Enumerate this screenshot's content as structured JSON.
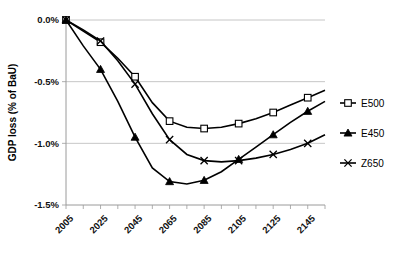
{
  "chart_data": {
    "type": "line",
    "title": "",
    "xlabel": "",
    "ylabel": "GDP loss (% of BaU)",
    "xlim": [
      2005,
      2155
    ],
    "ylim": [
      -1.5,
      0.0
    ],
    "grid": true,
    "legend_position": "right",
    "ytick_labels": [
      "0.0%",
      "-0.5%",
      "-1.0%",
      "-1.5%"
    ],
    "ytick_values": [
      0.0,
      -0.5,
      -1.0,
      -1.5
    ],
    "xtick_labels": [
      "2005",
      "2025",
      "2045",
      "2065",
      "2085",
      "2105",
      "2125",
      "2145"
    ],
    "xtick_values": [
      2005,
      2025,
      2045,
      2065,
      2085,
      2105,
      2125,
      2145
    ],
    "x": [
      2005,
      2015,
      2025,
      2035,
      2045,
      2055,
      2065,
      2075,
      2085,
      2095,
      2105,
      2115,
      2125,
      2135,
      2145,
      2155
    ],
    "series": [
      {
        "name": "E500",
        "marker": "open-square",
        "values": [
          0.0,
          -0.09,
          -0.18,
          -0.31,
          -0.46,
          -0.67,
          -0.82,
          -0.87,
          -0.88,
          -0.87,
          -0.84,
          -0.8,
          -0.75,
          -0.69,
          -0.63,
          -0.57
        ]
      },
      {
        "name": "E450",
        "marker": "filled-triangle",
        "values": [
          0.0,
          -0.21,
          -0.4,
          -0.66,
          -0.95,
          -1.2,
          -1.31,
          -1.33,
          -1.3,
          -1.23,
          -1.13,
          -1.03,
          -0.93,
          -0.83,
          -0.74,
          -0.66
        ]
      },
      {
        "name": "Z650",
        "marker": "x",
        "values": [
          0.0,
          -0.08,
          -0.17,
          -0.33,
          -0.52,
          -0.76,
          -0.97,
          -1.09,
          -1.14,
          -1.15,
          -1.14,
          -1.12,
          -1.09,
          -1.05,
          -1.0,
          -0.93
        ]
      }
    ]
  },
  "legend": {
    "items": [
      {
        "label": "E500",
        "marker": "open-square"
      },
      {
        "label": "E450",
        "marker": "filled-triangle"
      },
      {
        "label": "Z650",
        "marker": "x"
      }
    ]
  },
  "colors": {
    "series_stroke": "#000000",
    "gridline": "#b8b8b8",
    "axis": "#9a9a9a",
    "background": "#ffffff"
  }
}
